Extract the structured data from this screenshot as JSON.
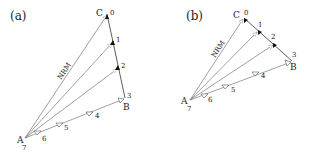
{
  "figure": {
    "panels": [
      {
        "label": "(a)",
        "vector_label": "NRM",
        "vertices": {
          "A": "A",
          "B": "B",
          "C": "C"
        },
        "step_labels": [
          "0",
          "1",
          "2",
          "3",
          "4",
          "5",
          "6",
          "7"
        ]
      },
      {
        "label": "(b)",
        "vector_label": "NRM",
        "vertices": {
          "A": "A",
          "B": "B",
          "C": "C"
        },
        "step_labels": [
          "0",
          "1",
          "2",
          "3",
          "4",
          "5",
          "6",
          "7"
        ]
      }
    ]
  }
}
